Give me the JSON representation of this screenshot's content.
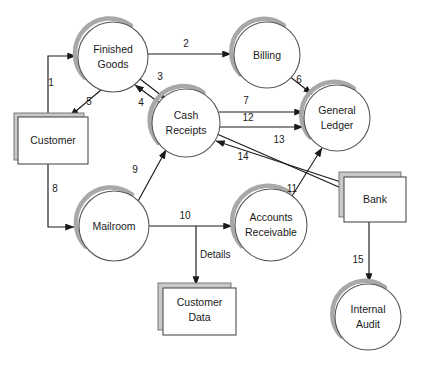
{
  "diagram": {
    "type": "data-flow-diagram",
    "title": "",
    "background_color": "#ffffff",
    "line_color": "#1a1a1a",
    "shadow_color": "#a8a8a8",
    "processes": [
      {
        "id": "finished-goods",
        "label_line1": "Finished",
        "label_line2": "Goods",
        "cx": 113,
        "cy": 57,
        "r": 35
      },
      {
        "id": "billing",
        "label_line1": "Billing",
        "label_line2": "",
        "cx": 267,
        "cy": 55,
        "r": 33
      },
      {
        "id": "cash-receipts",
        "label_line1": "Cash",
        "label_line2": "Receipts",
        "cx": 186,
        "cy": 123,
        "r": 34
      },
      {
        "id": "general-ledger",
        "label_line1": "General",
        "label_line2": "Ledger",
        "cx": 337,
        "cy": 118,
        "r": 33
      },
      {
        "id": "mailroom",
        "label_line1": "Mailroom",
        "label_line2": "",
        "cx": 114,
        "cy": 226,
        "r": 35
      },
      {
        "id": "accounts-receivable",
        "label_line1": "Accounts",
        "label_line2": "Receivable",
        "cx": 271,
        "cy": 225,
        "r": 36
      },
      {
        "id": "internal-audit",
        "label_line1": "Internal",
        "label_line2": "Audit",
        "cx": 368,
        "cy": 317,
        "r": 33
      }
    ],
    "entities": [
      {
        "id": "customer",
        "label_line1": "Customer",
        "label_line2": "",
        "x": 18,
        "y": 117,
        "w": 70,
        "h": 47
      },
      {
        "id": "bank",
        "label_line1": "Bank",
        "label_line2": "",
        "x": 344,
        "y": 177,
        "w": 62,
        "h": 45
      }
    ],
    "stores": [
      {
        "id": "customer-data",
        "label_line1": "Customer",
        "label_line2": "Data",
        "x": 163,
        "y": 288,
        "w": 73,
        "h": 47
      }
    ],
    "flows": [
      {
        "id": "flow-1",
        "label": "1",
        "from": "customer",
        "to": "finished-goods",
        "lx": 51,
        "ly": 83
      },
      {
        "id": "flow-2",
        "label": "2",
        "from": "finished-goods",
        "to": "billing",
        "lx": 186,
        "ly": 44
      },
      {
        "id": "flow-3",
        "label": "3",
        "from": "finished-goods",
        "to": "cash-receipts",
        "lx": 160,
        "ly": 77
      },
      {
        "id": "flow-4",
        "label": "4",
        "from": "cash-receipts",
        "to": "finished-goods",
        "lx": 141,
        "ly": 103
      },
      {
        "id": "flow-5",
        "label": "5",
        "from": "finished-goods",
        "to": "customer",
        "lx": 89,
        "ly": 102
      },
      {
        "id": "flow-6",
        "label": "6",
        "from": "billing",
        "to": "general-ledger",
        "lx": 299,
        "ly": 80
      },
      {
        "id": "flow-7",
        "label": "7",
        "from": "cash-receipts",
        "to": "general-ledger",
        "lx": 246,
        "ly": 101
      },
      {
        "id": "flow-8",
        "label": "8",
        "from": "customer",
        "to": "mailroom",
        "lx": 55,
        "ly": 189
      },
      {
        "id": "flow-9",
        "label": "9",
        "from": "mailroom",
        "to": "cash-receipts",
        "lx": 135,
        "ly": 170
      },
      {
        "id": "flow-10",
        "label": "10",
        "from": "mailroom",
        "to": "accounts-receivable",
        "lx": 185,
        "ly": 216
      },
      {
        "id": "flow-11",
        "label": "11",
        "from": "accounts-receivable",
        "to": "general-ledger",
        "lx": 292,
        "ly": 189
      },
      {
        "id": "flow-12",
        "label": "12",
        "from": "cash-receipts",
        "to": "general-ledger",
        "lx": 248,
        "ly": 118
      },
      {
        "id": "flow-13",
        "label": "13",
        "from": "cash-receipts",
        "to": "bank",
        "lx": 279,
        "ly": 140
      },
      {
        "id": "flow-14",
        "label": "14",
        "from": "bank",
        "to": "cash-receipts",
        "lx": 243,
        "ly": 157
      },
      {
        "id": "flow-15",
        "label": "15",
        "from": "bank",
        "to": "internal-audit",
        "lx": 358,
        "ly": 260
      },
      {
        "id": "flow-details",
        "label": "Details",
        "from": "flow-10",
        "to": "customer-data",
        "lx": 200,
        "ly": 255
      }
    ]
  }
}
